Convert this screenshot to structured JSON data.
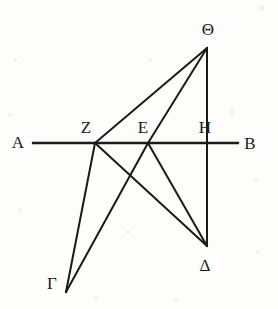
{
  "figure": {
    "background_color": "#fdfdfb",
    "stroke_color": "#1a1a1a",
    "width": 278,
    "height": 309
  },
  "points": [
    {
      "id": "A",
      "label": "Α",
      "name": "alpha",
      "x": 33,
      "y": 143,
      "label_x": 18,
      "label_y": 142
    },
    {
      "id": "Z",
      "label": "Ζ",
      "name": "zeta",
      "x": 95,
      "y": 143,
      "label_x": 86,
      "label_y": 127
    },
    {
      "id": "E",
      "label": "Ε",
      "name": "epsilon",
      "x": 148,
      "y": 143,
      "label_x": 143,
      "label_y": 127
    },
    {
      "id": "H",
      "label": "Η",
      "name": "eta",
      "x": 207,
      "y": 143,
      "label_x": 205,
      "label_y": 127
    },
    {
      "id": "B",
      "label": "Β",
      "name": "beta",
      "x": 238,
      "y": 143,
      "label_x": 250,
      "label_y": 143
    },
    {
      "id": "Theta",
      "label": "Θ",
      "name": "theta",
      "x": 207,
      "y": 48,
      "label_x": 208,
      "label_y": 29
    },
    {
      "id": "Delta",
      "label": "Δ",
      "name": "delta",
      "x": 207,
      "y": 246,
      "label_x": 205,
      "label_y": 265
    },
    {
      "id": "Gamma",
      "label": "Γ",
      "name": "gamma",
      "x": 66,
      "y": 292,
      "label_x": 52,
      "label_y": 283
    }
  ],
  "segments": [
    {
      "id": "AB",
      "from": "A",
      "to": "B",
      "name": "line-a-b",
      "width": 2.4
    },
    {
      "id": "ThetaZ",
      "from": "Theta",
      "to": "Z",
      "name": "line-theta-z",
      "width": 2.0
    },
    {
      "id": "ThetaE",
      "from": "Theta",
      "to": "E",
      "name": "line-theta-e",
      "width": 2.0
    },
    {
      "id": "ThetaD",
      "from": "Theta",
      "to": "Delta",
      "name": "line-theta-delta",
      "width": 2.0
    },
    {
      "id": "ZDelta",
      "from": "Z",
      "to": "Delta",
      "name": "line-z-delta",
      "width": 2.0
    },
    {
      "id": "EDelta",
      "from": "E",
      "to": "Delta",
      "name": "line-e-delta",
      "width": 2.0
    },
    {
      "id": "ZGamma",
      "from": "Z",
      "to": "Gamma",
      "name": "line-z-gamma",
      "width": 2.0
    },
    {
      "id": "EGamma",
      "from": "E",
      "to": "Gamma",
      "name": "line-e-gamma",
      "width": 2.0
    }
  ],
  "speckles": [
    {
      "x": 262,
      "y": 8,
      "r": 3.0
    },
    {
      "x": 15,
      "y": 60,
      "r": 2.4
    },
    {
      "x": 150,
      "y": 60,
      "r": 2.2
    },
    {
      "x": 232,
      "y": 112,
      "r": 2.6
    },
    {
      "x": 10,
      "y": 115,
      "r": 2.0
    },
    {
      "x": 256,
      "y": 180,
      "r": 2.4
    },
    {
      "x": 20,
      "y": 210,
      "r": 2.2
    },
    {
      "x": 128,
      "y": 232,
      "r": 2.0
    },
    {
      "x": 258,
      "y": 252,
      "r": 2.4
    },
    {
      "x": 96,
      "y": 298,
      "r": 2.0
    },
    {
      "x": 176,
      "y": 300,
      "r": 2.2
    }
  ]
}
